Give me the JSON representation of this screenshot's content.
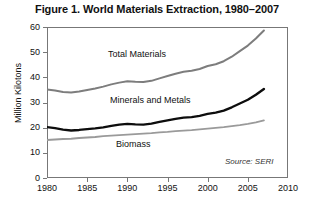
{
  "chart_data": {
    "type": "line",
    "title": "Figure 1. World Materials Extraction, 1980–2007",
    "xlabel": "",
    "ylabel": "Million Kilotons",
    "xlim": [
      1980,
      2010
    ],
    "ylim": [
      0,
      60
    ],
    "grid": false,
    "legend_position": "inline-annotations",
    "source_note": "Source: SERI",
    "xticks": [
      1980,
      1985,
      1990,
      1995,
      2000,
      2005,
      2010
    ],
    "xtick_labels": [
      "1980",
      "1985",
      "1990",
      "1995",
      "2000",
      "2005",
      "2010"
    ],
    "yticks": [
      0,
      10,
      20,
      30,
      40,
      50,
      60
    ],
    "ytick_labels": [
      "0",
      "10",
      "20",
      "30",
      "40",
      "50",
      "60"
    ],
    "x": [
      1980,
      1981,
      1982,
      1983,
      1984,
      1985,
      1986,
      1987,
      1988,
      1989,
      1990,
      1991,
      1992,
      1993,
      1994,
      1995,
      1996,
      1997,
      1998,
      1999,
      2000,
      2001,
      2002,
      2003,
      2004,
      2005,
      2006,
      2007
    ],
    "series": [
      {
        "name": "Total Materials",
        "color": "#7d7d7d",
        "width": 2.0,
        "values": [
          35.2,
          34.8,
          34.2,
          34.0,
          34.4,
          35.0,
          35.6,
          36.3,
          37.2,
          37.9,
          38.4,
          38.2,
          38.1,
          38.6,
          39.6,
          40.5,
          41.4,
          42.2,
          42.6,
          43.3,
          44.5,
          45.2,
          46.4,
          48.2,
          50.4,
          52.6,
          55.4,
          58.6
        ]
      },
      {
        "name": "Minerals and Metals",
        "color": "#0d0d0d",
        "width": 2.4,
        "values": [
          20.2,
          19.8,
          19.2,
          18.9,
          19.1,
          19.4,
          19.7,
          20.1,
          20.7,
          21.2,
          21.5,
          21.3,
          21.2,
          21.6,
          22.3,
          22.9,
          23.5,
          24.0,
          24.2,
          24.7,
          25.5,
          26.0,
          26.8,
          28.1,
          29.6,
          31.1,
          33.1,
          35.4
        ]
      },
      {
        "name": "Biomass",
        "color": "#9a9a9a",
        "width": 1.8,
        "values": [
          15.1,
          15.3,
          15.5,
          15.6,
          15.9,
          16.1,
          16.3,
          16.6,
          16.8,
          17.0,
          17.2,
          17.4,
          17.6,
          17.8,
          18.1,
          18.3,
          18.6,
          18.8,
          19.0,
          19.3,
          19.6,
          19.9,
          20.2,
          20.6,
          21.0,
          21.5,
          22.1,
          22.9
        ]
      }
    ]
  },
  "labels": {
    "total_materials": "Total Materials",
    "minerals_and_metals": "Minerals and Metals",
    "biomass": "Biomass"
  },
  "colors": {
    "axis": "#777777",
    "text": "#111111",
    "background": "#ffffff"
  }
}
